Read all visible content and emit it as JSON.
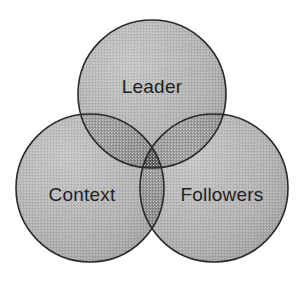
{
  "figure": {
    "name": "leader-context-followers-venn",
    "kind": "venn-diagram",
    "background_color": "#ffffff",
    "width": 302,
    "height": 281
  },
  "chart_data": {
    "type": "venn",
    "title": "",
    "subtitle": "",
    "xlabel": "",
    "ylabel": "",
    "set_count": 3,
    "categories": [
      "Leader",
      "Context",
      "Followers"
    ],
    "sets": [
      {
        "id": "leader",
        "label": "Leader",
        "position": "top",
        "center_x": 152,
        "center_y": 94,
        "radius": 74,
        "fill_color": "#b0b0b0",
        "stroke_color": "#2a2a2a",
        "label_x": 152,
        "label_y": 88
      },
      {
        "id": "context",
        "label": "Context",
        "position": "bottom-left",
        "center_x": 90,
        "center_y": 188,
        "radius": 74,
        "fill_color": "#b0b0b0",
        "stroke_color": "#2a2a2a",
        "label_x": 82,
        "label_y": 196
      },
      {
        "id": "followers",
        "label": "Followers",
        "position": "bottom-right",
        "center_x": 214,
        "center_y": 188,
        "radius": 74,
        "fill_color": "#b0b0b0",
        "stroke_color": "#2a2a2a",
        "label_x": 222,
        "label_y": 196
      }
    ],
    "intersections": [
      {
        "id": "leader-context",
        "label": "",
        "members": [
          "Leader",
          "Context"
        ],
        "fill_color": "#8a8a8a"
      },
      {
        "id": "leader-followers",
        "label": "",
        "members": [
          "Leader",
          "Followers"
        ],
        "fill_color": "#8a8a8a"
      },
      {
        "id": "context-followers",
        "label": "",
        "members": [
          "Context",
          "Followers"
        ],
        "fill_color": "#8a8a8a"
      },
      {
        "id": "leader-context-followers",
        "label": "",
        "members": [
          "Leader",
          "Context",
          "Followers"
        ],
        "fill_color": "#3c3c3c"
      }
    ],
    "legend": [],
    "annotations": [],
    "grid": false,
    "legend_position": "none"
  },
  "style": {
    "stroke_width": 1.6,
    "label_color": "#1f1f1f",
    "label_font_size": 19,
    "base_fill": "#b0b0b0",
    "pair_fill": "#8a8a8a",
    "triple_fill": "#3c3c3c",
    "texture": "halftone-dither"
  }
}
